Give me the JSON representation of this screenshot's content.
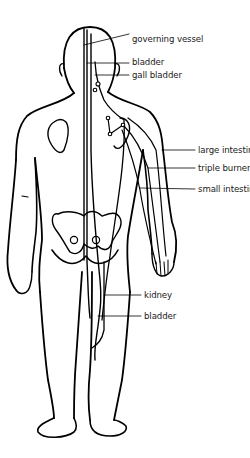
{
  "diagram": {
    "labels": [
      {
        "id": "governing-vessel",
        "text": "governing vessel",
        "x": 132,
        "y": 39
      },
      {
        "id": "bladder-upper",
        "text": "bladder",
        "x": 132,
        "y": 60
      },
      {
        "id": "gall-bladder",
        "text": "gall bladder",
        "x": 132,
        "y": 72
      },
      {
        "id": "large-intestine",
        "text": "large intestine",
        "x": 198,
        "y": 146
      },
      {
        "id": "triple-burner",
        "text": "triple burner",
        "x": 198,
        "y": 164
      },
      {
        "id": "small-intestine",
        "text": "small intestine",
        "x": 198,
        "y": 185
      },
      {
        "id": "kidney",
        "text": "kidney",
        "x": 144,
        "y": 291
      },
      {
        "id": "bladder-lower",
        "text": "bladder",
        "x": 144,
        "y": 312
      }
    ],
    "colors": {
      "line": "#000000",
      "text": "#1a1a1a",
      "background": "#ffffff"
    }
  }
}
